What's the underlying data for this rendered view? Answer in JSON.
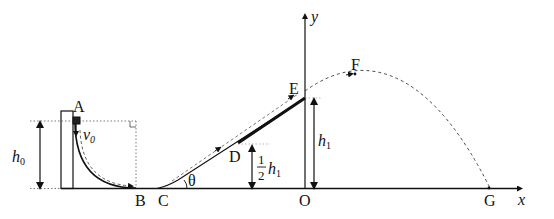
{
  "diagram": {
    "type": "physics-trajectory",
    "points": {
      "A": "A",
      "B": "B",
      "C": "C",
      "D": "D",
      "E": "E",
      "F": "F",
      "G": "G",
      "O": "O"
    },
    "axes": {
      "x": "x",
      "y": "y"
    },
    "symbols": {
      "v0": "v",
      "v0_sub": "0",
      "h0": "h",
      "h0_sub": "0",
      "h1": "h",
      "h1_sub": "1",
      "half_num": "1",
      "half_den": "2",
      "half_h": "h",
      "half_h_sub": "1",
      "theta": "θ"
    },
    "colors": {
      "stroke": "#111111",
      "background": "#ffffff"
    }
  }
}
